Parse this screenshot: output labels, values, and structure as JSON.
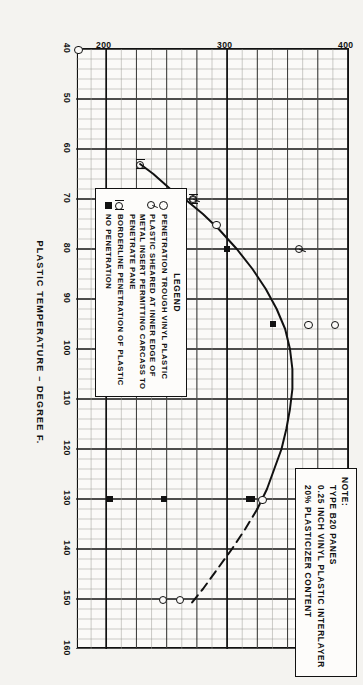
{
  "figure": {
    "note": {
      "title": "NOTE:",
      "lines": [
        "TYPE B20 PANES",
        "0.25 INCH VINYL PLASTIC INTERLAYER",
        "20% PLASTICIZER CONTENT"
      ]
    },
    "legend": {
      "title": "LEGEND",
      "entries": [
        {
          "symbol": "open-circle",
          "label": "PENETRATION TROUGH VINYL PLASTIC"
        },
        {
          "symbol": "sheared-circle",
          "label": "PLASTIC SHEARED AT INNER EDGE OF\nMETAL INSERT PERMITTING CARCASS TO\nPENETRATE PANE"
        },
        {
          "symbol": "borderline-circle",
          "label": "BORDERLINE PENETRATION OF PLASTIC"
        },
        {
          "symbol": "filled-square",
          "label": "NO PENETRATION"
        }
      ]
    }
  },
  "chart_data": {
    "type": "scatter",
    "title": "",
    "xlabel": "PLASTIC TEMPERATURE – DEGREE F.",
    "ylabel": "PENETRATION VELOCITY (4 LB. CHICKEN CARCASS) MPH",
    "xlim": [
      40,
      160
    ],
    "ylim": [
      175,
      400
    ],
    "xticks": [
      40,
      50,
      60,
      70,
      80,
      90,
      100,
      110,
      120,
      130,
      140,
      150,
      160
    ],
    "yticks": [
      200,
      300,
      400
    ],
    "xtick_labels": [
      "40",
      "50",
      "60",
      "70",
      "80",
      "90",
      "100",
      "110",
      "120",
      "130",
      "140",
      "150",
      "160"
    ],
    "ytick_labels": [
      "200",
      "300",
      "400"
    ],
    "grid": true,
    "minor_grid_step_x": 5,
    "minor_grid_step_y": 12.5,
    "series": [
      {
        "name": "PENETRATION TROUGH VINYL PLASTIC",
        "marker": "open-circle",
        "points": [
          [
            40,
            178
          ],
          [
            75,
            292
          ],
          [
            95,
            368
          ],
          [
            95,
            390
          ],
          [
            130,
            330
          ],
          [
            150,
            262
          ],
          [
            150,
            248
          ]
        ]
      },
      {
        "name": "PLASTIC SHEARED AT INNER EDGE OF METAL INSERT PERMITTING CARCASS TO PENETRATE PANE",
        "marker": "sheared-circle",
        "points": [
          [
            80,
            360
          ],
          [
            70,
            272
          ]
        ]
      },
      {
        "name": "BORDERLINE PENETRATION OF PLASTIC",
        "marker": "borderline-circle",
        "points": [
          [
            70,
            272
          ],
          [
            63,
            228
          ]
        ]
      },
      {
        "name": "NO PENETRATION",
        "marker": "filled-square",
        "points": [
          [
            80,
            300
          ],
          [
            95,
            338
          ],
          [
            130,
            320
          ],
          [
            130,
            318
          ],
          [
            130,
            248
          ],
          [
            130,
            203
          ]
        ]
      }
    ],
    "curve": {
      "name": "fitted ballistic limit curve",
      "solid_points": [
        [
          63,
          228
        ],
        [
          65,
          239
        ],
        [
          68,
          253
        ],
        [
          70,
          265
        ],
        [
          73,
          280
        ],
        [
          76,
          293
        ],
        [
          80,
          308
        ],
        [
          84,
          321
        ],
        [
          88,
          332
        ],
        [
          92,
          341
        ],
        [
          96,
          348
        ],
        [
          100,
          352
        ],
        [
          104,
          354
        ],
        [
          108,
          354
        ],
        [
          112,
          352
        ],
        [
          116,
          349
        ],
        [
          120,
          345
        ],
        [
          124,
          339
        ],
        [
          128,
          333
        ],
        [
          132,
          325
        ]
      ],
      "dashed_points": [
        [
          132,
          325
        ],
        [
          136,
          315
        ],
        [
          140,
          304
        ],
        [
          144,
          292
        ],
        [
          148,
          280
        ],
        [
          151,
          270
        ]
      ]
    }
  }
}
